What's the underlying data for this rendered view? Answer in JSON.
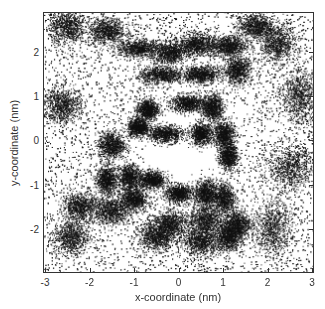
{
  "chart_data": {
    "type": "scatter",
    "subtype": "point-density",
    "title": "",
    "xlabel": "x-coordinate (nm)",
    "ylabel": "y-coordinate (nm)",
    "xlim": [
      -3,
      3
    ],
    "ylim": [
      -3,
      2.9
    ],
    "x_ticks": [
      -3,
      -2,
      -1,
      0,
      1,
      2,
      3
    ],
    "y_ticks": [
      -2,
      -1,
      0,
      1,
      2
    ],
    "x_tick_labels": [
      "-3",
      "-2",
      "-1",
      "0",
      "1",
      "2",
      "3"
    ],
    "y_tick_labels": [
      "-2",
      "-1",
      "0",
      "1",
      "2"
    ],
    "grid": false,
    "legend": null,
    "point_color": "#111111",
    "background_density": 0.35,
    "central_void": {
      "x": 0.1,
      "y": 0.0,
      "radius": 1.0
    },
    "dense_clusters": [
      {
        "x": -0.9,
        "y": 2.1,
        "sx": 0.25,
        "sy": 0.1
      },
      {
        "x": -0.2,
        "y": 2.0,
        "sx": 0.2,
        "sy": 0.12
      },
      {
        "x": 0.4,
        "y": 2.2,
        "sx": 0.2,
        "sy": 0.12
      },
      {
        "x": 1.1,
        "y": 2.15,
        "sx": 0.2,
        "sy": 0.12
      },
      {
        "x": -0.4,
        "y": 1.5,
        "sx": 0.25,
        "sy": 0.1
      },
      {
        "x": 0.5,
        "y": 1.5,
        "sx": 0.2,
        "sy": 0.1
      },
      {
        "x": 1.3,
        "y": 1.6,
        "sx": 0.15,
        "sy": 0.15
      },
      {
        "x": 0.2,
        "y": 0.85,
        "sx": 0.2,
        "sy": 0.1
      },
      {
        "x": 0.75,
        "y": 0.75,
        "sx": 0.12,
        "sy": 0.15
      },
      {
        "x": -0.7,
        "y": 0.7,
        "sx": 0.12,
        "sy": 0.12
      },
      {
        "x": -0.9,
        "y": 0.3,
        "sx": 0.12,
        "sy": 0.1
      },
      {
        "x": -0.3,
        "y": 0.15,
        "sx": 0.2,
        "sy": 0.1
      },
      {
        "x": 0.5,
        "y": 0.15,
        "sx": 0.12,
        "sy": 0.12
      },
      {
        "x": 1.0,
        "y": 0.15,
        "sx": 0.12,
        "sy": 0.15
      },
      {
        "x": 1.1,
        "y": -0.35,
        "sx": 0.1,
        "sy": 0.15
      },
      {
        "x": -1.5,
        "y": -0.1,
        "sx": 0.15,
        "sy": 0.15
      },
      {
        "x": -0.6,
        "y": -0.9,
        "sx": 0.15,
        "sy": 0.1
      },
      {
        "x": -1.1,
        "y": -0.85,
        "sx": 0.12,
        "sy": 0.15
      },
      {
        "x": -1.6,
        "y": -0.9,
        "sx": 0.12,
        "sy": 0.15
      },
      {
        "x": 0.0,
        "y": -1.2,
        "sx": 0.15,
        "sy": 0.1
      },
      {
        "x": 0.6,
        "y": -1.2,
        "sx": 0.12,
        "sy": 0.15
      },
      {
        "x": 1.0,
        "y": -1.3,
        "sx": 0.12,
        "sy": 0.18
      },
      {
        "x": -1.0,
        "y": -1.35,
        "sx": 0.15,
        "sy": 0.12
      },
      {
        "x": -2.2,
        "y": -1.5,
        "sx": 0.2,
        "sy": 0.15
      },
      {
        "x": -1.5,
        "y": -1.6,
        "sx": 0.2,
        "sy": 0.15
      },
      {
        "x": -0.2,
        "y": -1.9,
        "sx": 0.2,
        "sy": 0.15
      },
      {
        "x": 0.6,
        "y": -1.8,
        "sx": 0.18,
        "sy": 0.18
      },
      {
        "x": 1.3,
        "y": -1.9,
        "sx": 0.15,
        "sy": 0.15
      },
      {
        "x": -0.5,
        "y": -2.2,
        "sx": 0.2,
        "sy": 0.15
      },
      {
        "x": 0.5,
        "y": -2.3,
        "sx": 0.2,
        "sy": 0.15
      },
      {
        "x": 1.1,
        "y": -2.2,
        "sx": 0.15,
        "sy": 0.15
      },
      {
        "x": 2.1,
        "y": -2.0,
        "sx": 0.2,
        "sy": 0.3
      },
      {
        "x": -2.4,
        "y": -2.2,
        "sx": 0.2,
        "sy": 0.2
      },
      {
        "x": -2.5,
        "y": 2.6,
        "sx": 0.2,
        "sy": 0.2
      },
      {
        "x": 2.2,
        "y": 2.2,
        "sx": 0.2,
        "sy": 0.2
      },
      {
        "x": 2.7,
        "y": 1.0,
        "sx": 0.2,
        "sy": 0.3
      },
      {
        "x": -2.6,
        "y": 0.8,
        "sx": 0.2,
        "sy": 0.2
      },
      {
        "x": 2.5,
        "y": -0.6,
        "sx": 0.25,
        "sy": 0.25
      },
      {
        "x": 1.7,
        "y": 2.6,
        "sx": 0.2,
        "sy": 0.15
      },
      {
        "x": -1.6,
        "y": 2.5,
        "sx": 0.2,
        "sy": 0.15
      }
    ]
  }
}
